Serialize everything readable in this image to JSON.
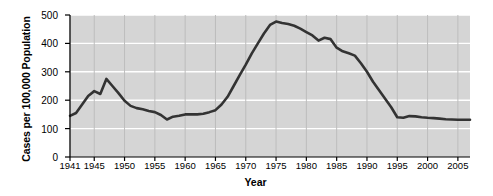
{
  "chart_data": {
    "type": "line",
    "title": "",
    "xlabel": "Year",
    "ylabel": "Cases per 100,000 Population",
    "xlim": [
      1941,
      2007
    ],
    "ylim": [
      0,
      500
    ],
    "yticks": [
      0,
      100,
      200,
      300,
      400,
      500
    ],
    "xticks": [
      1941,
      1945,
      1950,
      1955,
      1960,
      1965,
      1970,
      1975,
      1980,
      1985,
      1990,
      1995,
      2000,
      2005
    ],
    "grid": "horizontal white gridlines and vertical gray gridlines on gray panel",
    "legend": "none",
    "line_color": "#333333",
    "panel_color": "#d5d5d5",
    "gridline_color": "#ffffff",
    "x": [
      1941,
      1942,
      1943,
      1944,
      1945,
      1946,
      1947,
      1948,
      1949,
      1950,
      1951,
      1952,
      1953,
      1954,
      1955,
      1956,
      1957,
      1958,
      1959,
      1960,
      1961,
      1962,
      1963,
      1964,
      1965,
      1966,
      1967,
      1968,
      1969,
      1970,
      1971,
      1972,
      1973,
      1974,
      1975,
      1976,
      1977,
      1978,
      1979,
      1980,
      1981,
      1982,
      1983,
      1984,
      1985,
      1986,
      1987,
      1988,
      1989,
      1990,
      1991,
      1992,
      1993,
      1994,
      1995,
      1996,
      1997,
      1998,
      1999,
      2000,
      2001,
      2002,
      2003,
      2004,
      2005,
      2006,
      2007
    ],
    "values": [
      145,
      155,
      185,
      215,
      232,
      222,
      275,
      250,
      225,
      198,
      180,
      172,
      168,
      162,
      158,
      148,
      132,
      142,
      145,
      150,
      150,
      150,
      152,
      158,
      165,
      185,
      212,
      250,
      288,
      325,
      365,
      400,
      435,
      465,
      477,
      472,
      468,
      462,
      452,
      440,
      428,
      410,
      420,
      415,
      385,
      372,
      365,
      357,
      330,
      300,
      265,
      235,
      205,
      175,
      140,
      138,
      144,
      143,
      140,
      138,
      137,
      135,
      133,
      132,
      131,
      131,
      131
    ]
  },
  "axis": {
    "y_tick_labels": [
      "500",
      "400",
      "300",
      "200",
      "100",
      "0"
    ],
    "x_tick_labels": [
      "1941",
      "1945",
      "1950",
      "1955",
      "1960",
      "1965",
      "1970",
      "1975",
      "1980",
      "1985",
      "1990",
      "1995",
      "2000",
      "2005"
    ]
  }
}
